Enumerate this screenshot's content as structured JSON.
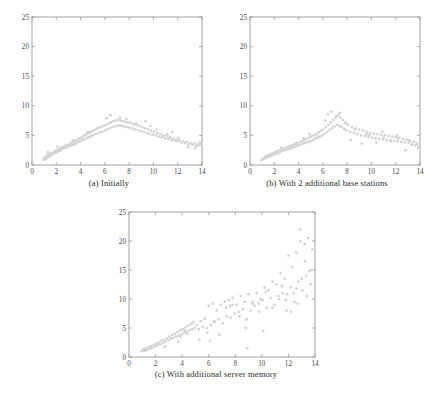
{
  "figure": {
    "title": "",
    "background_color": "#ffffff",
    "marker_color": "#d2d2d2",
    "axis_color": "#8d8d8d",
    "label_color": "#4a4a4a"
  },
  "panels": [
    {
      "id": "a",
      "caption": "(a) Initially"
    },
    {
      "id": "b",
      "caption": "(b) With 2 additional base stations"
    },
    {
      "id": "c",
      "caption": "(c) With additional server memory"
    }
  ],
  "chart_data": [
    {
      "type": "scatter",
      "title": "(a) Initially",
      "xlabel": "",
      "ylabel": "",
      "xlim": [
        0,
        14
      ],
      "ylim": [
        0,
        25
      ],
      "xticks": [
        0,
        2,
        4,
        6,
        8,
        10,
        12,
        14
      ],
      "yticks": [
        0,
        5,
        10,
        15,
        20,
        25
      ],
      "grid": false,
      "legend": "none",
      "marker": "dot",
      "marker_color": "#d2d2d2",
      "series": [
        {
          "name": "response time",
          "x": [
            0.95,
            1.02,
            1.12,
            1.18,
            1.25,
            1.33,
            1.41,
            1.48,
            1.55,
            1.62,
            1.7,
            1.78,
            1.85,
            1.92,
            2.0,
            2.08,
            2.15,
            2.22,
            2.3,
            2.38,
            2.45,
            2.52,
            2.6,
            2.68,
            2.75,
            2.83,
            2.9,
            2.98,
            3.05,
            3.13,
            3.2,
            3.28,
            3.35,
            3.43,
            3.5,
            3.58,
            3.65,
            3.73,
            3.8,
            3.88,
            3.95,
            4.03,
            4.1,
            4.18,
            4.25,
            4.33,
            4.4,
            4.48,
            4.55,
            4.63,
            4.7,
            4.78,
            4.85,
            4.93,
            5.0,
            5.1,
            5.2,
            5.3,
            5.4,
            5.5,
            5.6,
            5.7,
            5.8,
            5.9,
            6.0,
            6.1,
            6.2,
            6.3,
            6.4,
            6.5,
            6.6,
            6.7,
            6.8,
            6.9,
            7.0,
            7.1,
            7.2,
            7.3,
            7.4,
            7.5,
            7.6,
            7.7,
            7.8,
            7.9,
            8.0,
            8.12,
            8.24,
            8.36,
            8.48,
            8.6,
            8.72,
            8.84,
            8.96,
            9.08,
            9.2,
            9.32,
            9.44,
            9.56,
            9.68,
            9.8,
            9.92,
            10.05,
            10.18,
            10.31,
            10.44,
            10.57,
            10.7,
            10.83,
            10.96,
            11.09,
            11.22,
            11.35,
            11.48,
            11.61,
            11.74,
            11.87,
            12.0,
            12.15,
            12.3,
            12.45,
            12.6,
            12.75,
            12.9,
            13.05,
            13.2,
            13.35,
            13.5,
            13.62,
            13.72,
            13.82,
            13.9,
            13.95,
            1.3,
            2.1,
            3.4,
            4.6,
            5.35,
            6.45,
            7.25,
            8.55,
            9.35,
            10.25,
            11.15,
            12.05,
            12.85,
            13.45,
            6.15,
            7.75,
            9.75,
            11.55
          ],
          "y": [
            0.9,
            1.2,
            1.0,
            1.5,
            1.3,
            1.7,
            1.4,
            1.9,
            1.6,
            2.0,
            1.8,
            2.2,
            2.0,
            2.4,
            2.1,
            2.5,
            2.3,
            2.7,
            2.4,
            2.9,
            2.6,
            3.0,
            2.8,
            3.2,
            2.9,
            3.4,
            3.0,
            3.3,
            3.2,
            3.6,
            3.3,
            3.8,
            3.4,
            3.9,
            3.5,
            4.1,
            3.7,
            4.3,
            3.9,
            4.5,
            4.0,
            4.6,
            4.2,
            4.8,
            4.3,
            5.0,
            4.4,
            5.2,
            4.6,
            5.4,
            4.7,
            5.5,
            4.9,
            5.7,
            5.0,
            5.9,
            5.2,
            6.1,
            5.3,
            6.3,
            5.5,
            6.4,
            5.6,
            6.6,
            5.8,
            6.8,
            6.0,
            7.0,
            6.2,
            7.2,
            6.4,
            7.4,
            6.5,
            7.5,
            6.6,
            7.6,
            6.7,
            7.5,
            6.6,
            7.4,
            6.5,
            7.3,
            6.4,
            7.2,
            6.3,
            7.1,
            6.2,
            6.9,
            6.0,
            6.8,
            5.9,
            6.6,
            5.7,
            6.4,
            5.6,
            6.2,
            5.4,
            6.0,
            5.3,
            5.8,
            5.1,
            5.6,
            5.0,
            5.4,
            4.8,
            5.2,
            4.7,
            5.0,
            4.5,
            4.9,
            4.4,
            4.7,
            4.2,
            4.5,
            4.1,
            4.3,
            4.0,
            4.2,
            3.8,
            4.0,
            3.7,
            3.9,
            3.5,
            3.7,
            3.4,
            3.6,
            3.2,
            3.5,
            3.3,
            3.8,
            3.4,
            3.6,
            2.2,
            3.1,
            4.2,
            5.6,
            6.2,
            8.4,
            8.0,
            7.0,
            7.4,
            6.0,
            5.2,
            4.6,
            3.0,
            2.8,
            7.9,
            7.8,
            6.6,
            5.6
          ]
        }
      ]
    },
    {
      "type": "scatter",
      "title": "(b) With 2 additional base stations",
      "xlabel": "",
      "ylabel": "",
      "xlim": [
        0,
        14
      ],
      "ylim": [
        0,
        25
      ],
      "xticks": [
        0,
        2,
        4,
        6,
        8,
        10,
        12,
        14
      ],
      "yticks": [
        0,
        5,
        10,
        15,
        20,
        25
      ],
      "grid": false,
      "legend": "none",
      "marker": "dot",
      "marker_color": "#d2d2d2",
      "series": [
        {
          "name": "response time",
          "x": [
            0.95,
            1.05,
            1.15,
            1.25,
            1.35,
            1.45,
            1.55,
            1.65,
            1.75,
            1.85,
            1.95,
            2.05,
            2.15,
            2.25,
            2.35,
            2.45,
            2.55,
            2.65,
            2.75,
            2.85,
            2.95,
            3.05,
            3.15,
            3.25,
            3.35,
            3.45,
            3.55,
            3.65,
            3.75,
            3.85,
            3.95,
            4.05,
            4.15,
            4.25,
            4.35,
            4.45,
            4.55,
            4.65,
            4.75,
            4.85,
            4.95,
            5.05,
            5.15,
            5.25,
            5.35,
            5.45,
            5.55,
            5.65,
            5.75,
            5.85,
            5.95,
            6.05,
            6.15,
            6.25,
            6.35,
            6.45,
            6.55,
            6.65,
            6.75,
            6.85,
            6.95,
            7.05,
            7.15,
            7.25,
            7.35,
            7.45,
            7.55,
            7.65,
            7.75,
            7.85,
            7.95,
            8.1,
            8.25,
            8.4,
            8.55,
            8.7,
            8.85,
            9.0,
            9.15,
            9.3,
            9.45,
            9.6,
            9.75,
            9.9,
            10.05,
            10.2,
            10.35,
            10.5,
            10.65,
            10.8,
            10.95,
            11.1,
            11.25,
            11.4,
            11.55,
            11.7,
            11.85,
            12.0,
            12.15,
            12.3,
            12.45,
            12.6,
            12.75,
            12.9,
            13.05,
            13.2,
            13.35,
            13.5,
            13.62,
            13.74,
            13.84,
            13.92,
            1.4,
            2.6,
            3.8,
            4.9,
            6.2,
            7.4,
            8.6,
            9.8,
            11.0,
            12.2,
            13.3,
            5.6,
            6.7,
            7.9,
            9.2,
            10.4,
            11.6,
            12.8,
            6.4,
            7.1,
            8.3,
            9.6,
            10.9,
            12.1,
            13.1,
            2.2,
            3.3,
            4.4
          ],
          "y": [
            0.8,
            1.1,
            1.0,
            1.4,
            1.2,
            1.6,
            1.4,
            1.8,
            1.5,
            2.0,
            1.7,
            2.1,
            1.9,
            2.3,
            2.0,
            2.5,
            2.2,
            2.6,
            2.4,
            2.8,
            2.5,
            3.0,
            2.7,
            3.1,
            2.8,
            3.3,
            3.0,
            3.5,
            3.1,
            3.7,
            3.3,
            3.8,
            3.4,
            4.0,
            3.6,
            4.2,
            3.7,
            4.4,
            3.9,
            4.6,
            4.0,
            4.8,
            4.2,
            5.0,
            4.4,
            5.2,
            4.6,
            5.5,
            4.8,
            5.8,
            5.0,
            6.0,
            5.3,
            6.4,
            5.6,
            6.8,
            5.9,
            7.2,
            6.2,
            7.6,
            6.5,
            8.0,
            6.8,
            8.4,
            6.6,
            8.0,
            6.4,
            7.6,
            6.1,
            7.2,
            5.9,
            6.8,
            5.6,
            6.4,
            5.4,
            6.2,
            5.2,
            6.0,
            5.0,
            5.8,
            4.9,
            5.6,
            4.7,
            5.4,
            4.6,
            5.3,
            4.5,
            5.2,
            4.4,
            5.1,
            4.3,
            5.0,
            4.2,
            4.9,
            4.2,
            4.8,
            4.1,
            4.7,
            4.0,
            4.6,
            3.9,
            4.4,
            3.8,
            4.3,
            3.7,
            4.1,
            3.5,
            3.9,
            3.3,
            3.6,
            2.9,
            3.2,
            1.3,
            2.9,
            3.6,
            5.2,
            7.5,
            8.8,
            6.0,
            5.0,
            4.6,
            4.4,
            3.4,
            4.8,
            9.0,
            7.0,
            3.6,
            3.8,
            4.0,
            2.5,
            8.6,
            8.2,
            4.2,
            5.2,
            5.6,
            5.0,
            4.2,
            2.3,
            3.2,
            4.6
          ]
        }
      ]
    },
    {
      "type": "scatter",
      "title": "(c) With additional server memory",
      "xlabel": "",
      "ylabel": "",
      "xlim": [
        0,
        14
      ],
      "ylim": [
        0,
        25
      ],
      "xticks": [
        0,
        2,
        4,
        6,
        8,
        10,
        12,
        14
      ],
      "yticks": [
        0,
        5,
        10,
        15,
        20,
        25
      ],
      "grid": false,
      "legend": "none",
      "marker": "dot",
      "marker_color": "#d2d2d2",
      "series": [
        {
          "name": "response time",
          "x": [
            0.95,
            1.05,
            1.15,
            1.25,
            1.35,
            1.45,
            1.55,
            1.65,
            1.75,
            1.85,
            1.95,
            2.05,
            2.15,
            2.25,
            2.35,
            2.45,
            2.55,
            2.65,
            2.75,
            2.85,
            2.95,
            3.05,
            3.15,
            3.25,
            3.35,
            3.45,
            3.55,
            3.65,
            3.75,
            3.85,
            3.95,
            4.05,
            4.15,
            4.25,
            4.35,
            4.45,
            4.55,
            4.65,
            4.75,
            4.85,
            4.95,
            5.1,
            5.25,
            5.4,
            5.55,
            5.7,
            5.85,
            6.0,
            6.15,
            6.3,
            6.45,
            6.6,
            6.75,
            6.9,
            7.05,
            7.2,
            7.35,
            7.5,
            7.65,
            7.8,
            7.95,
            8.1,
            8.25,
            8.4,
            8.55,
            8.7,
            8.85,
            9.0,
            9.15,
            9.3,
            9.45,
            9.6,
            9.75,
            9.9,
            10.05,
            10.2,
            10.35,
            10.5,
            10.65,
            10.8,
            10.95,
            11.1,
            11.25,
            11.4,
            11.55,
            11.7,
            11.85,
            12.0,
            12.15,
            12.3,
            12.45,
            12.6,
            12.75,
            12.9,
            13.05,
            13.2,
            13.35,
            13.5,
            13.65,
            13.8,
            1.2,
            1.6,
            2.1,
            2.7,
            3.2,
            3.7,
            4.2,
            4.7,
            5.3,
            5.9,
            6.4,
            6.8,
            7.3,
            7.8,
            8.3,
            8.8,
            9.3,
            9.8,
            10.3,
            10.8,
            11.3,
            11.8,
            12.2,
            12.6,
            13.0,
            13.4,
            13.7,
            3.9,
            4.4,
            6.1,
            7.6,
            8.9,
            10.1,
            11.5,
            12.4,
            13.25,
            12.9,
            13.6,
            11.9,
            12.7
          ],
          "y": [
            1.0,
            1.3,
            1.1,
            1.5,
            1.2,
            1.7,
            1.4,
            1.9,
            1.6,
            2.1,
            1.8,
            2.3,
            2.0,
            2.5,
            2.2,
            2.8,
            2.4,
            3.0,
            2.6,
            3.2,
            2.9,
            3.5,
            3.1,
            3.8,
            3.3,
            4.0,
            3.5,
            4.3,
            3.7,
            4.6,
            3.9,
            4.8,
            4.1,
            5.1,
            4.4,
            5.4,
            4.6,
            5.7,
            4.8,
            6.0,
            5.0,
            5.5,
            4.8,
            6.2,
            5.2,
            6.6,
            5.0,
            8.8,
            5.5,
            9.2,
            6.0,
            8.0,
            6.5,
            9.0,
            5.8,
            9.5,
            7.0,
            9.8,
            6.8,
            10.2,
            7.5,
            9.0,
            7.8,
            10.5,
            8.2,
            9.5,
            6.5,
            10.8,
            8.0,
            9.2,
            8.8,
            11.0,
            9.2,
            10.0,
            9.8,
            12.0,
            8.5,
            11.5,
            10.2,
            13.0,
            9.0,
            12.5,
            10.5,
            14.5,
            11.0,
            13.5,
            8.0,
            17.5,
            12.0,
            15.5,
            9.5,
            18.0,
            13.0,
            22.0,
            11.5,
            19.5,
            14.0,
            20.5,
            12.5,
            18.5,
            1.2,
            1.5,
            2.0,
            1.8,
            3.2,
            2.6,
            4.5,
            5.6,
            3.0,
            4.2,
            6.2,
            3.8,
            8.5,
            9.0,
            7.0,
            5.0,
            9.5,
            7.8,
            11.2,
            8.5,
            10.0,
            9.8,
            7.8,
            11.8,
            13.5,
            10.5,
            15.0,
            3.5,
            4.0,
            2.8,
            8.8,
            1.5,
            4.5,
            12.2,
            11.0,
            16.5,
            20.0,
            14.8,
            10.8,
            9.2
          ]
        }
      ]
    }
  ]
}
